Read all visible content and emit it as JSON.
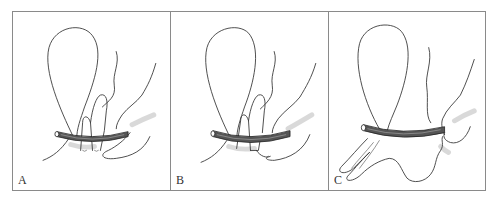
{
  "figure": {
    "panels": [
      {
        "id": "A",
        "label": "A"
      },
      {
        "id": "B",
        "label": "B"
      },
      {
        "id": "C",
        "label": "C"
      }
    ]
  },
  "colors": {
    "line": "#3a3a3a",
    "frame": "#8a8a8a",
    "band": "#555555",
    "shading": "#cfcfcf",
    "background": "#ffffff"
  }
}
